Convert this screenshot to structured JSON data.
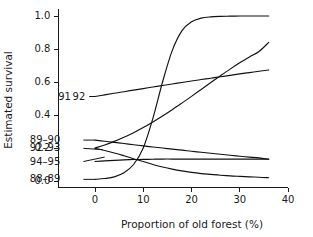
{
  "chart_data": {
    "type": "line",
    "title": "",
    "xlabel": "Proportion of old forest (%)",
    "ylabel": "Estimated survival",
    "xlim": [
      -8,
      40
    ],
    "ylim": [
      -0.04,
      1.04
    ],
    "xticks": [
      0,
      10,
      20,
      30,
      40
    ],
    "xtick_labels": [
      "0",
      "10",
      "20",
      "30",
      "40"
    ],
    "yticks": [
      0.0,
      0.2,
      0.4,
      0.6,
      0.8,
      1.0
    ],
    "ytick_labels": [
      "0.0",
      "0.2",
      "0.4",
      "0.6",
      "0.8",
      "1.0"
    ],
    "grid": false,
    "legend_position": "inline-left-labels",
    "line_color": "#111111",
    "x": [
      0,
      2,
      4,
      6,
      8,
      10,
      12,
      14,
      16,
      18,
      20,
      22,
      24,
      26,
      28,
      30,
      32,
      34,
      36
    ],
    "series": [
      {
        "name": "88-89",
        "label": "88–89",
        "label_x": -7.2,
        "label_y": 0.01,
        "values": [
          0.01,
          0.015,
          0.025,
          0.05,
          0.1,
          0.2,
          0.38,
          0.6,
          0.79,
          0.91,
          0.965,
          0.987,
          0.995,
          0.998,
          0.999,
          1.0,
          1.0,
          1.0,
          1.0
        ]
      },
      {
        "name": "91",
        "label": "91",
        "label_x": -5.0,
        "label_y": 0.512,
        "values": [
          0.512,
          0.522,
          0.532,
          0.541,
          0.551,
          0.56,
          0.57,
          0.579,
          0.588,
          0.597,
          0.606,
          0.615,
          0.623,
          0.632,
          0.64,
          0.649,
          0.657,
          0.665,
          0.673
        ]
      },
      {
        "name": "92",
        "label": "92",
        "label_x": -2.0,
        "label_y": 0.512,
        "values": [
          0.2,
          0.218,
          0.24,
          0.265,
          0.293,
          0.324,
          0.358,
          0.394,
          0.432,
          0.472,
          0.513,
          0.555,
          0.597,
          0.638,
          0.678,
          0.716,
          0.752,
          0.785,
          0.84
        ]
      },
      {
        "name": "89-90",
        "label": "89–90",
        "label_x": -7.2,
        "label_y": 0.248,
        "values": [
          0.248,
          0.241,
          0.234,
          0.227,
          0.22,
          0.213,
          0.206,
          0.2,
          0.193,
          0.187,
          0.18,
          0.174,
          0.168,
          0.162,
          0.156,
          0.15,
          0.145,
          0.14,
          0.132
        ]
      },
      {
        "name": "94-95",
        "label": "94–95",
        "label_x": -7.2,
        "label_y": 0.118,
        "values": [
          0.118,
          0.122,
          0.125,
          0.128,
          0.13,
          0.131,
          0.132,
          0.133,
          0.133,
          0.133,
          0.133,
          0.133,
          0.133,
          0.133,
          0.133,
          0.133,
          0.133,
          0.133,
          0.133
        ]
      },
      {
        "name": "92-93",
        "label": "92–93",
        "label_x": -7.2,
        "label_y": 0.198,
        "values": [
          0.198,
          0.185,
          0.17,
          0.153,
          0.135,
          0.118,
          0.1,
          0.085,
          0.072,
          0.061,
          0.052,
          0.045,
          0.04,
          0.035,
          0.031,
          0.028,
          0.025,
          0.023,
          0.02
        ]
      }
    ],
    "leaders": [
      {
        "name": "leader-91-92",
        "x1": -1.2,
        "y1": 0.512,
        "x2": 0.0,
        "y2": 0.512
      },
      {
        "name": "leader-89-90",
        "x1": -2.4,
        "y1": 0.248,
        "x2": 0.0,
        "y2": 0.248
      },
      {
        "name": "leader-92-93",
        "x1": -2.4,
        "y1": 0.198,
        "x2": 1.6,
        "y2": 0.19
      },
      {
        "name": "leader-94-95",
        "x1": -2.4,
        "y1": 0.118,
        "x2": 2.0,
        "y2": 0.145
      },
      {
        "name": "leader-88-89",
        "x1": -2.4,
        "y1": 0.01,
        "x2": 0.0,
        "y2": 0.01
      }
    ]
  }
}
